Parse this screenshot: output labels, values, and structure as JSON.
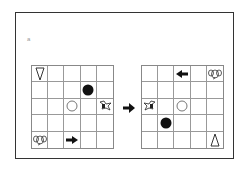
{
  "label": "a",
  "grids": {
    "left": {
      "rows": 5,
      "cols": 5,
      "items": [
        {
          "row": 0,
          "col": 0,
          "icon": "triangle-down-icon"
        },
        {
          "row": 1,
          "col": 3,
          "icon": "black-circle-icon"
        },
        {
          "row": 2,
          "col": 2,
          "icon": "white-circle-icon"
        },
        {
          "row": 2,
          "col": 4,
          "icon": "bird-icon"
        },
        {
          "row": 4,
          "col": 0,
          "icon": "elephant-icon"
        },
        {
          "row": 4,
          "col": 2,
          "icon": "arrow-right-icon"
        }
      ]
    },
    "right": {
      "rows": 5,
      "cols": 5,
      "items": [
        {
          "row": 0,
          "col": 2,
          "icon": "arrow-left-icon"
        },
        {
          "row": 0,
          "col": 4,
          "icon": "elephant-icon"
        },
        {
          "row": 2,
          "col": 0,
          "icon": "bird-icon"
        },
        {
          "row": 2,
          "col": 2,
          "icon": "white-circle-icon"
        },
        {
          "row": 3,
          "col": 1,
          "icon": "black-circle-icon"
        },
        {
          "row": 4,
          "col": 4,
          "icon": "triangle-up-icon"
        }
      ]
    }
  },
  "transform_arrow": "arrow-right-icon",
  "colors": {
    "line": "#999999",
    "ink": "#111111",
    "frame": "#333333"
  }
}
